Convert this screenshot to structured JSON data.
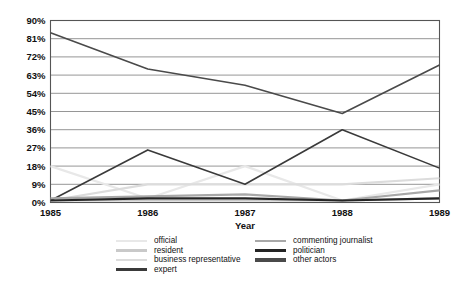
{
  "chart_data": {
    "type": "line",
    "title": "",
    "xlabel": "Year",
    "ylabel": "",
    "categories": [
      "1985",
      "1986",
      "1987",
      "1988",
      "1989"
    ],
    "x": [
      1985,
      1986,
      1987,
      1988,
      1989
    ],
    "ylim": [
      0,
      90
    ],
    "yticks": [
      0,
      9,
      18,
      27,
      36,
      45,
      54,
      63,
      72,
      81,
      90
    ],
    "ytick_labels": [
      "0%",
      "9%",
      "18%",
      "27%",
      "36%",
      "45%",
      "54%",
      "63%",
      "72%",
      "81%",
      "90%"
    ],
    "xtick_labels": [
      "1985",
      "1986",
      "1987",
      "1988",
      "1989"
    ],
    "grid": true,
    "grid_axis": "y",
    "legend_position": "bottom",
    "series": [
      {
        "name": "official",
        "color": "#e8e8e8",
        "width": 2.2,
        "values": [
          18,
          2,
          18,
          1,
          9
        ]
      },
      {
        "name": "resident",
        "color": "#c9c9c9",
        "width": 2.2,
        "values": [
          1,
          1,
          1,
          1,
          2
        ]
      },
      {
        "name": "business representative",
        "color": "#dcdcdc",
        "width": 2.2,
        "values": [
          1,
          9,
          9,
          9,
          12
        ]
      },
      {
        "name": "expert",
        "color": "#3a3a3a",
        "width": 1.6,
        "values": [
          1,
          26,
          9,
          36,
          17
        ]
      },
      {
        "name": "commenting journalist",
        "color": "#a8a8a8",
        "width": 2.2,
        "values": [
          2,
          3,
          4,
          1,
          6
        ]
      },
      {
        "name": "politician",
        "color": "#242424",
        "width": 2.2,
        "values": [
          1,
          2,
          2,
          1,
          2
        ]
      },
      {
        "name": "other actors",
        "color": "#4a4a4a",
        "width": 1.6,
        "values": [
          84,
          66,
          58,
          44,
          68
        ]
      }
    ]
  },
  "legend": {
    "columns": [
      {
        "items": [
          {
            "label": "official",
            "color": "#e8e8e8",
            "width": 2.2
          },
          {
            "label": "resident",
            "color": "#c9c9c9",
            "width": 2.4
          },
          {
            "label": "business representative",
            "color": "#dcdcdc",
            "width": 2.4
          },
          {
            "label": "expert",
            "color": "#3a3a3a",
            "width": 3.2
          }
        ]
      },
      {
        "items": [
          {
            "label": "commenting journalist",
            "color": "#a8a8a8",
            "width": 2.6
          },
          {
            "label": "politician",
            "color": "#242424",
            "width": 3.2
          },
          {
            "label": "other actors",
            "color": "#4a4a4a",
            "width": 3.2
          }
        ]
      }
    ]
  },
  "axes": {
    "frame_color": "#555555",
    "grid_color": "#8a8a8a",
    "x_axis_title": "Year"
  }
}
